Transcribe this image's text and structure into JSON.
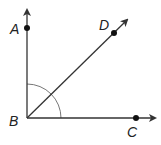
{
  "diagram": {
    "vertex": {
      "label": "B"
    },
    "points": [
      {
        "label": "A",
        "ray": "BA"
      },
      {
        "label": "D",
        "ray": "BD"
      },
      {
        "label": "C",
        "ray": "BC"
      }
    ],
    "colors": {
      "line": "#333333",
      "arc": "#777777",
      "point": "#111111"
    }
  }
}
